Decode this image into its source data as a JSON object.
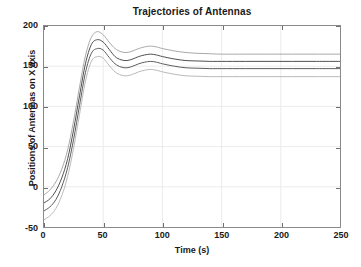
{
  "chart_data": {
    "type": "line",
    "title": "Trajectories of Antennas",
    "xlabel": "Time (s)",
    "ylabel": "Positions of Antennas on X axis",
    "xlim": [
      0,
      250
    ],
    "ylim": [
      -50,
      200
    ],
    "xticks": [
      0,
      50,
      100,
      150,
      200,
      250
    ],
    "yticks": [
      -50,
      0,
      50,
      100,
      150,
      200
    ],
    "xtick_labels": [
      "0",
      "50",
      "100",
      "150",
      "200",
      "250"
    ],
    "ytick_labels": [
      "-50",
      "0",
      "50",
      "100",
      "150",
      "200"
    ],
    "grid": true,
    "legend": null,
    "legend_position": "none",
    "x": [
      0,
      5,
      10,
      15,
      20,
      25,
      30,
      35,
      40,
      45,
      50,
      55,
      60,
      65,
      70,
      75,
      80,
      85,
      90,
      95,
      100,
      110,
      120,
      130,
      140,
      150,
      170,
      190,
      210,
      230,
      250
    ],
    "series": [
      {
        "name": "antenna-1",
        "color": "#9e9e9e",
        "width": 0.9,
        "steady_state": 165,
        "peak": 193,
        "peak_time": 44,
        "values": [
          -10,
          -4,
          6,
          22,
          46,
          82,
          124,
          163,
          186,
          193,
          189,
          180,
          172,
          168,
          167,
          169,
          172,
          174,
          175,
          174,
          172,
          169,
          167,
          166,
          165.5,
          165,
          165,
          165,
          165,
          165,
          165
        ]
      },
      {
        "name": "antenna-2",
        "color": "#4d4d4d",
        "width": 1.0,
        "steady_state": 156,
        "peak": 183,
        "peak_time": 45,
        "values": [
          -20,
          -15,
          -5,
          11,
          35,
          71,
          113,
          153,
          177,
          183,
          180,
          171,
          162,
          158,
          157,
          159,
          162,
          164,
          165,
          164,
          162,
          159,
          157,
          156.5,
          156,
          156,
          156,
          156,
          156,
          156,
          156
        ]
      },
      {
        "name": "antenna-3",
        "color": "#5a5a5a",
        "width": 1.0,
        "steady_state": 147,
        "peak": 172,
        "peak_time": 46,
        "values": [
          -30,
          -25,
          -16,
          0,
          24,
          59,
          101,
          142,
          166,
          172,
          170,
          161,
          153,
          149,
          148,
          150,
          153,
          155,
          156,
          155,
          153,
          150,
          148,
          147.5,
          147,
          147,
          147,
          147,
          147,
          147,
          147
        ]
      },
      {
        "name": "antenna-4",
        "color": "#b0b0b0",
        "width": 0.9,
        "steady_state": 137,
        "peak": 162,
        "peak_time": 47,
        "values": [
          -41,
          -36,
          -27,
          -11,
          13,
          48,
          90,
          131,
          156,
          162,
          160,
          151,
          143,
          139,
          138,
          140,
          143,
          145,
          146,
          145,
          143,
          140,
          138,
          137.5,
          137,
          137,
          137,
          137,
          137,
          137,
          137
        ]
      }
    ]
  },
  "axes": {
    "grid_color": "#ebebeb",
    "box_color": "#8a8a8a",
    "tick_color": "#6e6e6e",
    "text_color": "#1a1a1a",
    "background": "#ffffff"
  }
}
